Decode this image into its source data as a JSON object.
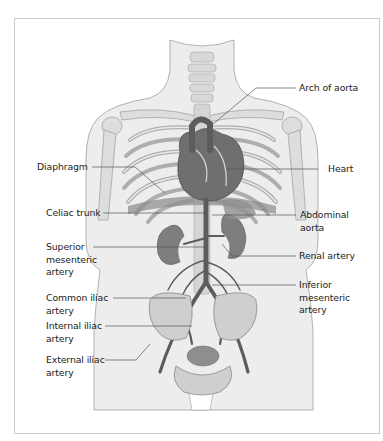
{
  "diagram": {
    "colors": {
      "frame": "#c8c8c8",
      "skin": "#ececec",
      "outline": "#9a9a9a",
      "bone": "#e2e2e2",
      "organ": "#8a8a8a",
      "artery": "#6b6b6b",
      "leader": "#555555",
      "text": "#222222"
    },
    "labels": {
      "arch_of_aorta": "Arch of aorta",
      "diaphragm": "Diaphragm",
      "heart": "Heart",
      "celiac_trunk": "Celiac trunk",
      "abdominal_aorta": "Abdominal\naorta",
      "superior_mesenteric_artery": "Superior\nmesenteric\nartery",
      "renal_artery": "Renal artery",
      "common_iliac_artery": "Common iliac\nartery",
      "inferior_mesenteric_artery": "Inferior\nmesenteric\n artery",
      "internal_iliac_artery": "Internal iliac\nartery",
      "external_iliac_artery": "External iliac\nartery"
    }
  }
}
